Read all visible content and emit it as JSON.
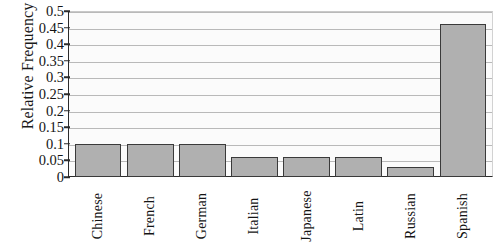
{
  "chart_data": {
    "type": "bar",
    "title": "",
    "xlabel": "",
    "ylabel": "Relative Frequency",
    "categories": [
      "Chinese",
      "French",
      "German",
      "Italian",
      "Japanese",
      "Latin",
      "Russian",
      "Spanish"
    ],
    "values": [
      0.1,
      0.1,
      0.1,
      0.06,
      0.06,
      0.06,
      0.03,
      0.46
    ],
    "ylim": [
      0,
      0.5
    ],
    "ytick_labels": [
      "0.5",
      "0.45",
      "0.4",
      "0.35",
      "0.3",
      "0.25",
      "0.2",
      "0.15",
      "0.1",
      "0.05",
      "0"
    ],
    "ytick_values": [
      0.5,
      0.45,
      0.4,
      0.35,
      0.3,
      0.25,
      0.2,
      0.15,
      0.1,
      0.05,
      0
    ],
    "grid": true,
    "legend": false,
    "legend_position": "none",
    "bar_color": "#b0b0b0",
    "bar_edge_color": "#3a3a3a",
    "gridline_color": "#b9b9b9",
    "axis_color": "#2b2b2b",
    "plot_background": "#fbfbfb"
  }
}
